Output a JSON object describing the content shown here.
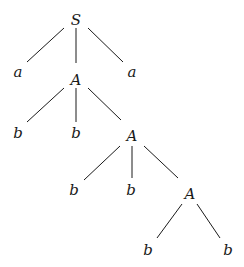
{
  "diagram": {
    "type": "parse-tree",
    "nodes": [
      {
        "id": "n0",
        "label": "S",
        "x": 76,
        "y": 20
      },
      {
        "id": "n1",
        "label": "a",
        "x": 18,
        "y": 72
      },
      {
        "id": "n2",
        "label": "A",
        "x": 76,
        "y": 80
      },
      {
        "id": "n3",
        "label": "a",
        "x": 132,
        "y": 72
      },
      {
        "id": "n4",
        "label": "b",
        "x": 18,
        "y": 133
      },
      {
        "id": "n5",
        "label": "b",
        "x": 76,
        "y": 133
      },
      {
        "id": "n6",
        "label": "A",
        "x": 132,
        "y": 136
      },
      {
        "id": "n7",
        "label": "b",
        "x": 74,
        "y": 190
      },
      {
        "id": "n8",
        "label": "b",
        "x": 131,
        "y": 190
      },
      {
        "id": "n9",
        "label": "A",
        "x": 190,
        "y": 194
      },
      {
        "id": "n10",
        "label": "b",
        "x": 148,
        "y": 250
      },
      {
        "id": "n11",
        "label": "b",
        "x": 228,
        "y": 250
      }
    ],
    "edges": [
      {
        "from": "n0",
        "to": "n1",
        "x1": 64,
        "y1": 28,
        "x2": 27,
        "y2": 62
      },
      {
        "from": "n0",
        "to": "n2",
        "x1": 76,
        "y1": 28,
        "x2": 76,
        "y2": 63
      },
      {
        "from": "n0",
        "to": "n3",
        "x1": 88,
        "y1": 28,
        "x2": 123,
        "y2": 62
      },
      {
        "from": "n2",
        "to": "n4",
        "x1": 64,
        "y1": 88,
        "x2": 27,
        "y2": 122
      },
      {
        "from": "n2",
        "to": "n5",
        "x1": 76,
        "y1": 88,
        "x2": 76,
        "y2": 122
      },
      {
        "from": "n2",
        "to": "n6",
        "x1": 88,
        "y1": 88,
        "x2": 121,
        "y2": 120
      },
      {
        "from": "n6",
        "to": "n7",
        "x1": 120,
        "y1": 146,
        "x2": 84,
        "y2": 180
      },
      {
        "from": "n6",
        "to": "n8",
        "x1": 132,
        "y1": 146,
        "x2": 132,
        "y2": 178
      },
      {
        "from": "n6",
        "to": "n9",
        "x1": 144,
        "y1": 146,
        "x2": 178,
        "y2": 178
      },
      {
        "from": "n9",
        "to": "n10",
        "x1": 182,
        "y1": 204,
        "x2": 157,
        "y2": 238
      },
      {
        "from": "n9",
        "to": "n11",
        "x1": 197,
        "y1": 204,
        "x2": 220,
        "y2": 238
      }
    ]
  }
}
